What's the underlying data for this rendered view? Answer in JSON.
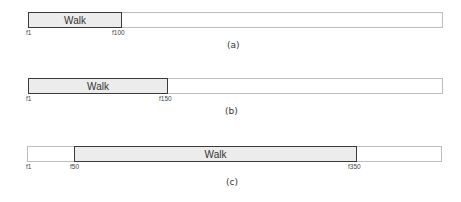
{
  "figure": {
    "track_border_color": "#bdbdbd",
    "segment_border_color": "#3a3a3a",
    "segment_fill_color": "#ececec",
    "panels": [
      {
        "caption": "(a)",
        "segment_label": "Walk",
        "start_label": "f1",
        "segment_start_label": "f1",
        "segment_end_label": "f100"
      },
      {
        "caption": "(b)",
        "segment_label": "Walk",
        "start_label": "f1",
        "segment_start_label": "f1",
        "segment_end_label": "f150"
      },
      {
        "caption": "(c)",
        "segment_label": "Walk",
        "start_label": "f1",
        "segment_start_label": "f50",
        "segment_end_label": "f350"
      }
    ]
  }
}
